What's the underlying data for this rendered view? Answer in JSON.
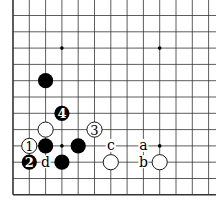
{
  "board": {
    "cols": 13,
    "rows": 12,
    "edges": [
      "left",
      "bottom"
    ],
    "star_points": [
      [
        3,
        2
      ],
      [
        9,
        2
      ],
      [
        3,
        8
      ],
      [
        9,
        8
      ]
    ],
    "stones": [
      {
        "col": 2,
        "row": 4,
        "color": "black",
        "label": ""
      },
      {
        "col": 3,
        "row": 6,
        "color": "black",
        "label": "4"
      },
      {
        "col": 2,
        "row": 7,
        "color": "white",
        "label": ""
      },
      {
        "col": 5,
        "row": 7,
        "color": "white",
        "label": "3"
      },
      {
        "col": 1,
        "row": 8,
        "color": "white",
        "label": "1"
      },
      {
        "col": 2,
        "row": 8,
        "color": "black",
        "label": ""
      },
      {
        "col": 4,
        "row": 8,
        "color": "black",
        "label": ""
      },
      {
        "col": 1,
        "row": 9,
        "color": "black",
        "label": "2"
      },
      {
        "col": 3,
        "row": 9,
        "color": "black",
        "label": ""
      },
      {
        "col": 6,
        "row": 9,
        "color": "white",
        "label": ""
      },
      {
        "col": 9,
        "row": 9,
        "color": "white",
        "label": ""
      }
    ],
    "markers": [
      {
        "col": 6,
        "row": 8,
        "label": "c"
      },
      {
        "col": 8,
        "row": 8,
        "label": "a"
      },
      {
        "col": 2,
        "row": 9,
        "label": "d"
      },
      {
        "col": 8,
        "row": 9,
        "label": "b"
      }
    ],
    "colors": {
      "line": "#333333",
      "black_stone": "#000000",
      "white_stone": "#ffffff",
      "text_on_black": "#ffffff",
      "text_on_white": "#000000"
    }
  }
}
